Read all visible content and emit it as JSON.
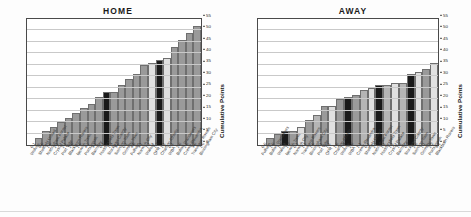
{
  "figure": {
    "y_axis_label": "Cumulative Points",
    "y_ticks": [
      0,
      5,
      10,
      15,
      20,
      25,
      30,
      35,
      40,
      45,
      50,
      55
    ],
    "colors": {
      "bar_default": "#9a9a9a",
      "bar_dark": "#1a1a1a",
      "bar_light": "#e0e0e0",
      "bar_mid": "#b5b5b5",
      "grid": "#c9c9c9",
      "frame": "#4a4a4a",
      "title": "#1a1a1a"
    }
  },
  "panels": [
    {
      "title": "HOME",
      "name": "home-chart"
    },
    {
      "title": "AWAY",
      "name": "away-chart"
    }
  ],
  "chart_data": [
    {
      "type": "bar",
      "title": "HOME",
      "xlabel": "",
      "ylabel": "Cumulative Points",
      "ylim": [
        0,
        55
      ],
      "yticks": [
        0,
        5,
        10,
        15,
        20,
        25,
        30,
        35,
        40,
        45,
        50,
        55
      ],
      "grid": true,
      "legend": "none",
      "categories": [
        "Wolves",
        "Sheffield United",
        "Nottingham Forest",
        "Crystal Palace",
        "Port Vale",
        "Blackburn Rovers",
        "Ipswich Town",
        "Portsmouth",
        "Barnsley",
        "Huddersfield Town",
        "Stockport County",
        "Swindon Town",
        "Grimsby Town",
        "Fulham",
        "Norwich City",
        "Walsall",
        "QPR",
        "Charlton Athletic",
        "WBA",
        "Bolton Wanderers",
        "Crewe Alexandra",
        "Tranmere Rovers",
        "Birmingham City"
      ],
      "scores": [
        "0-1",
        "8-0",
        "1-0",
        "2-1",
        "2-1",
        "2-0",
        "1-0",
        "4-2",
        "3-1",
        "0-1",
        "1-3",
        "3-0",
        "0-1",
        "4-0",
        "3-1",
        "1-1",
        "1-3",
        "1-1",
        "0-1",
        "2-0",
        "2-0",
        "3-0",
        "1-0"
      ],
      "values": [
        0,
        3,
        6,
        8,
        10,
        12,
        14,
        16,
        18,
        21,
        23,
        23,
        26,
        29,
        31,
        35,
        36,
        37,
        38,
        43,
        46,
        49,
        52
      ],
      "bar_styles": [
        "default",
        "default",
        "default",
        "default",
        "default",
        "default",
        "default",
        "default",
        "default",
        "default",
        "dark",
        "default",
        "default",
        "default",
        "default",
        "default",
        "light",
        "dark",
        "light",
        "default",
        "default",
        "default",
        "default"
      ]
    },
    {
      "type": "bar",
      "title": "AWAY",
      "xlabel": "",
      "ylabel": "Cumulative Points",
      "ylim": [
        0,
        55
      ],
      "yticks": [
        0,
        5,
        10,
        15,
        20,
        25,
        30,
        35,
        40,
        45,
        50,
        55
      ],
      "grid": true,
      "legend": "none",
      "categories": [
        "Fulham",
        "Bolton Wanderers",
        "Walsall",
        "Ipswich Town",
        "Norwich City",
        "Tranmere Rovers",
        "Birmingham City",
        "Port Vale",
        "QPR",
        "Charlton Athletic",
        "Wolves",
        "WBA",
        "Crewe Alexandra",
        "Sheffield United",
        "Nottingham Forest",
        "Huddersfield Town",
        "Crystal Palace",
        "Barnsley",
        "Stockport County",
        "Swindon Town",
        "Grimsby Town",
        "Portsmouth",
        "Blackburn Rovers"
      ],
      "scores": [
        "0-0",
        "1-0",
        "1-0",
        "1-2",
        "0-1",
        "1-1",
        "1-0",
        "2-1",
        "1-1",
        "1-0",
        "1-4",
        "2-0",
        "1-1",
        "0-1",
        "2-1",
        "1-1",
        "1-1",
        "1-2",
        "0-2",
        "2-0",
        "1-1",
        "2-2",
        "4-1"
      ],
      "values": [
        0,
        3,
        5,
        6,
        6,
        8,
        11,
        13,
        17,
        17,
        20,
        21,
        22,
        24,
        25,
        26,
        26,
        27,
        27,
        31,
        32,
        33,
        36
      ],
      "bar_styles": [
        "default",
        "default",
        "default",
        "dark",
        "default",
        "light",
        "default",
        "mid",
        "default",
        "light",
        "default",
        "dark",
        "default",
        "mid",
        "light",
        "dark",
        "mid",
        "light",
        "mid",
        "dark",
        "light",
        "default",
        "light",
        "default"
      ]
    }
  ]
}
